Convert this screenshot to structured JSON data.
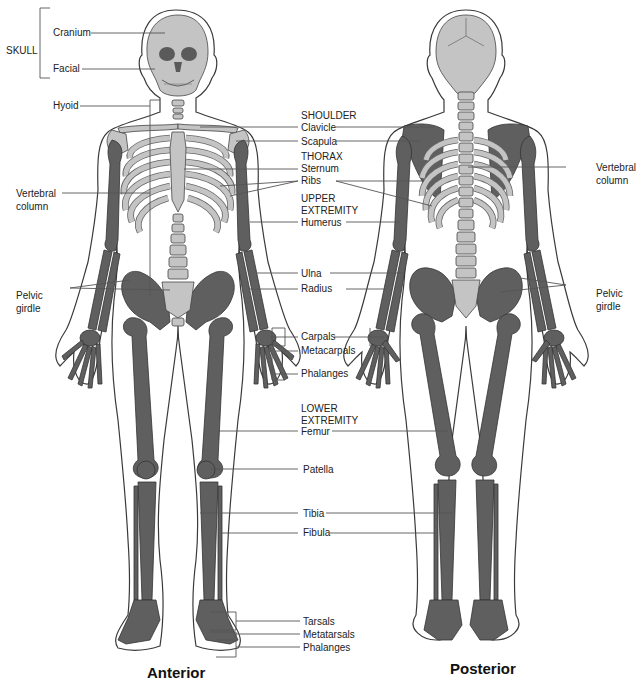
{
  "figure": {
    "views": [
      {
        "id": "anterior",
        "caption": "Anterior"
      },
      {
        "id": "posterior",
        "caption": "Posterior"
      }
    ]
  },
  "colors": {
    "axial_bone": "#c4c4c4",
    "appendicular_bone": "#5f5f5f",
    "skin_outline": "#3a3a3a",
    "leader_line": "#555555",
    "background": "#ffffff"
  },
  "labels": {
    "skull_group": "SKULL",
    "cranium": "Cranium",
    "facial": "Facial",
    "hyoid": "Hyoid",
    "vertebral_column_left": [
      "Vertebral",
      "column"
    ],
    "pelvic_girdle_left": [
      "Pelvic",
      "girdle"
    ],
    "shoulder_group": "SHOULDER",
    "clavicle": "Clavicle",
    "scapula": "Scapula",
    "thorax_group": "THORAX",
    "sternum": "Sternum",
    "ribs": "Ribs",
    "upper_extremity_group": [
      "UPPER",
      "EXTREMITY"
    ],
    "humerus": "Humerus",
    "ulna": "Ulna",
    "radius": "Radius",
    "carpals": "Carpals",
    "metacarpals": "Metacarpals",
    "hand_phalanges": "Phalanges",
    "lower_extremity_group": [
      "LOWER",
      "EXTREMITY"
    ],
    "femur": "Femur",
    "patella": "Patella",
    "tibia": "Tibia",
    "fibula": "Fibula",
    "tarsals": "Tarsals",
    "metatarsals": "Metatarsals",
    "foot_phalanges": "Phalanges",
    "vertebral_column_right": [
      "Vertebral",
      "column"
    ],
    "pelvic_girdle_right": [
      "Pelvic",
      "girdle"
    ]
  }
}
